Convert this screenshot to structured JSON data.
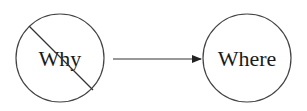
{
  "diagram": {
    "nodes": [
      {
        "id": "why",
        "label": "Why",
        "crossed_out": true
      },
      {
        "id": "where",
        "label": "Where",
        "crossed_out": false
      }
    ],
    "edges": [
      {
        "from": "why",
        "to": "where",
        "type": "arrow"
      }
    ],
    "colors": {
      "stroke": "#333333",
      "text": "#1a1a1a",
      "background": "#ffffff"
    }
  }
}
